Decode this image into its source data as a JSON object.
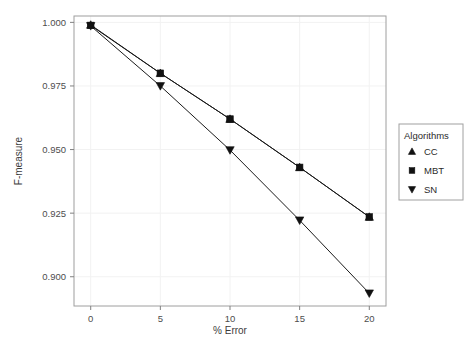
{
  "chart_data": {
    "type": "line",
    "title": "",
    "subtitle": "",
    "xlabel": "% Error",
    "ylabel": "F-measure",
    "x": [
      0,
      5,
      10,
      15,
      20
    ],
    "xlim": [
      -1.2,
      21.2
    ],
    "ylim": [
      0.8885,
      1.0025
    ],
    "xticks": [
      0,
      5,
      10,
      15,
      20
    ],
    "xticklabels": [
      "0",
      "5",
      "10",
      "15",
      "20"
    ],
    "yticks": [
      0.9,
      0.925,
      0.95,
      0.975,
      1.0
    ],
    "yticklabels": [
      "0.900",
      "0.925",
      "0.950",
      "0.975",
      "1.000"
    ],
    "grid": true,
    "grid_color": "#f2f2f2",
    "panel_background": "#ffffff",
    "panel_border_color": "#9e9e9e",
    "line_color": "#1a1a1a",
    "marker_color": "#111111",
    "legend_position": "right",
    "series": [
      {
        "name": "CC",
        "marker": "triangle-up",
        "values": [
          0.999,
          0.98,
          0.962,
          0.943,
          0.9235
        ]
      },
      {
        "name": "MBT",
        "marker": "square",
        "values": [
          0.9988,
          0.98,
          0.962,
          0.943,
          0.9235
        ]
      },
      {
        "name": "SN",
        "marker": "triangle-down",
        "values": [
          0.9986,
          0.975,
          0.9498,
          0.9222,
          0.8935
        ]
      }
    ]
  },
  "legend": {
    "title": "Algorithms",
    "entries": [
      {
        "label": "CC",
        "marker": "triangle-up"
      },
      {
        "label": "MBT",
        "marker": "square"
      },
      {
        "label": "SN",
        "marker": "triangle-down"
      }
    ],
    "background": "#ffffff",
    "border_color": "#a0a0a0"
  },
  "axes": {
    "x_title": "% Error",
    "y_title": "F-measure",
    "x_tick_labels": [
      "0",
      "5",
      "10",
      "15",
      "20"
    ],
    "y_tick_labels": [
      "0.900",
      "0.925",
      "0.950",
      "0.975",
      "1.000"
    ]
  }
}
